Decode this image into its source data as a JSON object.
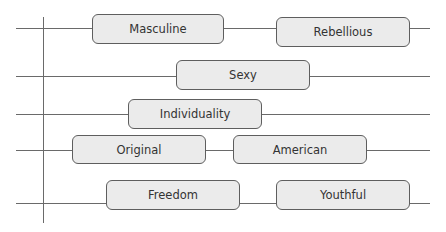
{
  "diagram": {
    "type": "attribute-rows",
    "rows": [
      {
        "nodes": [
          "Masculine",
          "Rebellious"
        ]
      },
      {
        "nodes": [
          "Sexy"
        ]
      },
      {
        "nodes": [
          "Individuality"
        ]
      },
      {
        "nodes": [
          "Original",
          "American"
        ]
      },
      {
        "nodes": [
          "Freedom",
          "Youthful"
        ]
      }
    ]
  },
  "colors": {
    "line": "#6a6a6a",
    "node_fill": "#ebebeb",
    "node_border": "#5e5e5e",
    "text": "#333333"
  }
}
